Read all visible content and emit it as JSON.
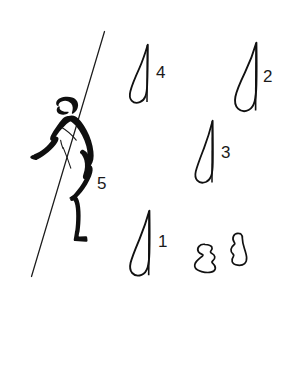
{
  "figure": {
    "background_color": "#ffffff",
    "ink_color": "#111111",
    "width": 294,
    "height": 374
  },
  "labels": [
    {
      "id": "label-1",
      "text": "1",
      "x": 158,
      "y": 247,
      "refers_to": "lunate-microlith-1"
    },
    {
      "id": "label-2",
      "text": "2",
      "x": 263,
      "y": 82,
      "refers_to": "lunate-microlith-2"
    },
    {
      "id": "label-3",
      "text": "3",
      "x": 221,
      "y": 158,
      "refers_to": "lunate-microlith-3"
    },
    {
      "id": "label-4",
      "text": "4",
      "x": 156,
      "y": 78,
      "refers_to": "lunate-microlith-4"
    },
    {
      "id": "label-5",
      "text": "5",
      "x": 97,
      "y": 189,
      "refers_to": "human-figure"
    }
  ],
  "artifacts": [
    {
      "id": "lunate-microlith-4",
      "name": "lunate-microlith-4",
      "label": "4",
      "type": "crescent-blade",
      "bbox": {
        "x": 129,
        "y": 43,
        "w": 20,
        "h": 60
      }
    },
    {
      "id": "lunate-microlith-2",
      "name": "lunate-microlith-2",
      "label": "2",
      "type": "crescent-blade",
      "bbox": {
        "x": 235,
        "y": 41,
        "w": 23,
        "h": 71
      }
    },
    {
      "id": "lunate-microlith-3",
      "name": "lunate-microlith-3",
      "label": "3",
      "type": "crescent-blade",
      "bbox": {
        "x": 194,
        "y": 119,
        "w": 20,
        "h": 66
      }
    },
    {
      "id": "lunate-microlith-1",
      "name": "lunate-microlith-1",
      "label": "1",
      "type": "crescent-blade",
      "bbox": {
        "x": 129,
        "y": 209,
        "w": 22,
        "h": 69
      }
    },
    {
      "id": "flake-left",
      "name": "unlabelled-flake-left",
      "label": "",
      "type": "irregular-flake",
      "bbox": {
        "x": 194,
        "y": 243,
        "w": 22,
        "h": 30
      }
    },
    {
      "id": "flake-right",
      "name": "unlabelled-flake-right",
      "label": "",
      "type": "irregular-flake",
      "bbox": {
        "x": 230,
        "y": 232,
        "w": 19,
        "h": 34
      }
    }
  ],
  "human_figure": {
    "id": "human-figure",
    "name": "stylised-human-figure",
    "label": "5",
    "description": "bent-over stylised human in profile with outstretched arm",
    "bbox": {
      "x": 30,
      "y": 95,
      "w": 70,
      "h": 150
    }
  },
  "shaft_line": {
    "id": "shaft-line",
    "name": "diagonal-shaft-line",
    "description": "long diagonal line crossing the human figure",
    "start": {
      "x": 104,
      "y": 31
    },
    "end": {
      "x": 31,
      "y": 276
    }
  }
}
